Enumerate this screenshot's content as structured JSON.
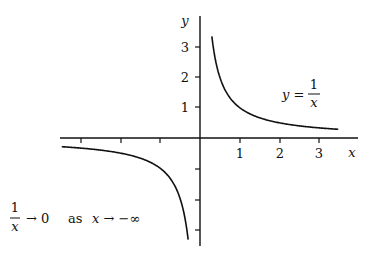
{
  "chart_data": {
    "type": "line",
    "title": "",
    "xlabel": "x",
    "ylabel": "y",
    "function": "y = 1/x",
    "x_ticks": [
      -3,
      -2,
      -1,
      1,
      2,
      3
    ],
    "x_tick_labels": [
      "1",
      "2",
      "3"
    ],
    "y_ticks": [
      -3,
      -2,
      -1,
      1,
      2,
      3
    ],
    "y_tick_labels": [
      "1",
      "2",
      "3"
    ],
    "xlim": [
      -3.5,
      3.7
    ],
    "ylim": [
      -3.5,
      3.8
    ],
    "grid": false,
    "series": [
      {
        "name": "y = 1/x (x > 0)",
        "x_range": [
          0.3,
          3.5
        ]
      },
      {
        "name": "y = 1/x (x < 0)",
        "x_range": [
          -3.5,
          -0.3
        ]
      }
    ],
    "annotations": [
      {
        "text": "y = 1/x",
        "position": "upper right"
      },
      {
        "text": "1/x → 0 as x → −∞",
        "position": "lower left"
      }
    ]
  },
  "labels": {
    "x_axis": "x",
    "y_axis": "y",
    "tick_x": [
      "1",
      "2",
      "3"
    ],
    "tick_y": [
      "1",
      "2",
      "3"
    ],
    "eq_lhs": "y =",
    "eq_num": "1",
    "eq_den": "x",
    "limit_num": "1",
    "limit_den": "x",
    "limit_rest_1": "→ 0",
    "limit_as": "as",
    "limit_rest_2": "x → −∞"
  }
}
